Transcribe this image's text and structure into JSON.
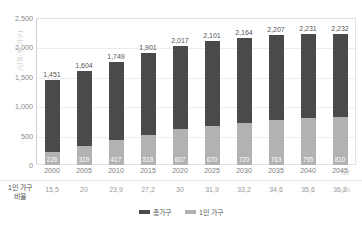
{
  "axis": {
    "unit_title": "(단위: 만 가구)",
    "y_ticks": [
      "2,500",
      "2,000",
      "1,500",
      "1,000",
      "500",
      "0"
    ],
    "year_unit": "(년)",
    "percent_unit": "(%)"
  },
  "ratio_row": {
    "label_line1": "1인 가구",
    "label_line2": "비율"
  },
  "legend": {
    "items": [
      {
        "name": "total-households",
        "label": "총가구",
        "color": "#4a4a4a"
      },
      {
        "name": "single-person-households",
        "label": "1인 가구",
        "color": "#b2b2b2"
      }
    ]
  },
  "chart_data": {
    "type": "bar",
    "title": "",
    "subtitle": "",
    "xlabel": "(년)",
    "ylabel": "(단위: 만 가구)",
    "ylim": [
      0,
      2500
    ],
    "yticks": [
      0,
      500,
      1000,
      1500,
      2000,
      2500
    ],
    "grid": true,
    "legend_position": "bottom-center",
    "stacked": true,
    "categories": [
      "2000",
      "2005",
      "2010",
      "2015",
      "2020",
      "2025",
      "2030",
      "2035",
      "2040",
      "2045"
    ],
    "series": [
      {
        "name": "총가구",
        "color": "#4a4a4a",
        "values": [
          1451,
          1604,
          1749,
          1901,
          2017,
          2101,
          2164,
          2207,
          2231,
          2232
        ],
        "labels": [
          "1,451",
          "1,604",
          "1,749",
          "1,901",
          "2,017",
          "2,101",
          "2,164",
          "2,207",
          "2,231",
          "2,232"
        ]
      },
      {
        "name": "1인 가구",
        "color": "#b2b2b2",
        "values": [
          226,
          319,
          417,
          518,
          607,
          670,
          720,
          763,
          795,
          810
        ],
        "labels": [
          "226",
          "319",
          "417",
          "518",
          "607",
          "670",
          "720",
          "763",
          "795",
          "810"
        ]
      }
    ],
    "annotations": {
      "row_label": "1인 가구 비율",
      "row_unit": "(%)",
      "ratio_values": [
        15.5,
        20,
        23.9,
        27.2,
        30,
        31.9,
        33.2,
        34.6,
        35.6,
        36.2
      ],
      "ratio_labels": [
        "15,5",
        "20",
        "23,9",
        "27,2",
        "30",
        "31,9",
        "33,2",
        "34,6",
        "35,6",
        "36,2"
      ]
    }
  }
}
